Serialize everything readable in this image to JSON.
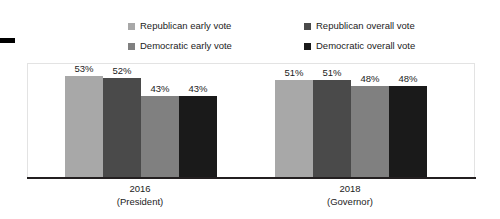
{
  "chart_data": {
    "type": "bar",
    "title": "",
    "subtitle": "",
    "xlabel": "",
    "ylabel": "",
    "ylim": [
      0,
      60
    ],
    "grid": false,
    "legend_position": "top",
    "categories": [
      "2016\n(President)",
      "2018\n(Governor)"
    ],
    "category_labels": [
      {
        "year": "2016",
        "office": "(President)"
      },
      {
        "year": "2018",
        "office": "(Governor)"
      }
    ],
    "series": [
      {
        "name": "Republican early vote",
        "color": "#a8a8a8",
        "values": [
          53,
          51
        ],
        "value_labels": [
          "53%",
          "51%"
        ]
      },
      {
        "name": "Republican overall vote",
        "color": "#4a4a4a",
        "values": [
          52,
          51
        ],
        "value_labels": [
          "52%",
          "51%"
        ]
      },
      {
        "name": "Democratic early vote",
        "color": "#808080",
        "values": [
          43,
          48
        ],
        "value_labels": [
          "43%",
          "48%"
        ]
      },
      {
        "name": "Democratic overall vote",
        "color": "#1a1a1a",
        "values": [
          43,
          48
        ],
        "value_labels": [
          "43%",
          "48%"
        ]
      }
    ]
  },
  "legend": {
    "items": [
      {
        "label": "Republican early vote",
        "color": "#a8a8a8"
      },
      {
        "label": "Republican overall vote",
        "color": "#4a4a4a"
      },
      {
        "label": "Democratic early vote",
        "color": "#808080"
      },
      {
        "label": "Democratic overall vote",
        "color": "#1a1a1a"
      }
    ]
  },
  "axis": {
    "baseline_color": "#231f20"
  }
}
